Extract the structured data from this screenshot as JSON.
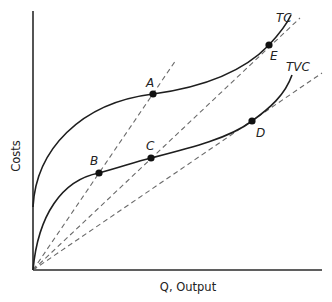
{
  "chart_data": {
    "type": "line",
    "title": "",
    "xlabel": "Q, Output",
    "ylabel": "Costs",
    "grid": false,
    "legend": "none (curves labeled directly)",
    "axes": {
      "origin_px": [
        33,
        270
      ],
      "x_end_px": [
        322,
        270
      ],
      "y_end_px": [
        33,
        11
      ]
    },
    "series": [
      {
        "name": "TC",
        "label": "TC",
        "style": "solid",
        "label_px": [
          276,
          22
        ],
        "path": "M33,207 C36,150 80,103 153,94 C205,87 245,70 269,45 C280,33 287,24 291,15"
      },
      {
        "name": "TVC",
        "label": "TVC",
        "style": "solid",
        "label_px": [
          286,
          71
        ],
        "path": "M33,270 C38,215 62,180 99,173 C118,168 135,162 151,158 C190,148 230,138 252,121 C270,108 285,95 292,75"
      }
    ],
    "rays": [
      {
        "name": "ray-through-B-A",
        "from": [
          33,
          270
        ],
        "to": [
          176,
          60
        ],
        "style": "dashed",
        "passes_through": [
          "B",
          "A"
        ]
      },
      {
        "name": "ray-through-C-E",
        "from": [
          33,
          270
        ],
        "to": [
          300,
          18
        ],
        "style": "dashed",
        "passes_through": [
          "C",
          "E"
        ]
      },
      {
        "name": "ray-through-D",
        "from": [
          33,
          270
        ],
        "to": [
          322,
          73
        ],
        "style": "dashed",
        "passes_through": [
          "D"
        ]
      }
    ],
    "points": [
      {
        "id": "A",
        "on": "TC",
        "px": [
          153,
          94
        ],
        "label_px": [
          146,
          87
        ]
      },
      {
        "id": "B",
        "on": "TVC",
        "px": [
          99,
          173
        ],
        "label_px": [
          90,
          165
        ]
      },
      {
        "id": "C",
        "on": "TVC",
        "px": [
          151,
          158
        ],
        "label_px": [
          146,
          150
        ]
      },
      {
        "id": "D",
        "on": "TVC",
        "px": [
          252,
          121
        ],
        "label_px": [
          256,
          137
        ]
      },
      {
        "id": "E",
        "on": "TC",
        "px": [
          269,
          45
        ],
        "label_px": [
          270,
          60
        ]
      }
    ],
    "annotations": [
      "TC intercepts the cost axis above the origin (fixed cost)",
      "TVC starts at origin",
      "Dashed rays from origin: tangent to TVC at D, tangent to TC at E, and through B/A and C"
    ]
  }
}
